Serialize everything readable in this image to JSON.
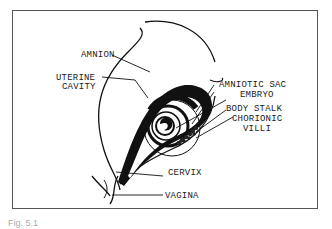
{
  "figure": {
    "labels": {
      "amnion": "AMNION",
      "uterine_cavity_1": "UTERINE",
      "uterine_cavity_2": "CAVITY",
      "amniotic_sac": "AMNIOTIC SAC",
      "embryo": "EMBRYO",
      "body_stalk": "BODY STALK",
      "chorionic_villi_1": "CHORIONIC",
      "chorionic_villi_2": "VILLI",
      "cervix": "CERVIX",
      "vagina": "VAGINA"
    },
    "caption": "Fig. 5.1"
  }
}
